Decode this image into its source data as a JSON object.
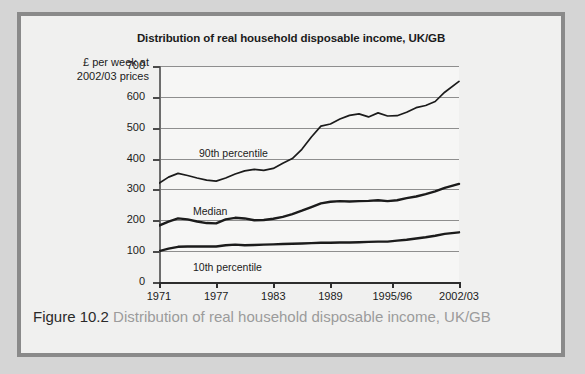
{
  "figure": {
    "number_label": "Figure 10.2",
    "caption_text": "Distribution of real household disposable income, UK/GB"
  },
  "chart_data": {
    "type": "line",
    "title": "Distribution of real household disposable income, UK/GB",
    "ylabel": "£ per week at 2002/03 prices",
    "xlabel": "",
    "ylim": [
      0,
      700
    ],
    "ytick_labels": [
      "0",
      "100",
      "200",
      "300",
      "400",
      "500",
      "600",
      "700"
    ],
    "ytick_values": [
      0,
      100,
      200,
      300,
      400,
      500,
      600,
      700
    ],
    "xtick_labels": [
      "1971",
      "1977",
      "1983",
      "1989",
      "1995/96",
      "2002/03"
    ],
    "xtick_values": [
      1971,
      1977,
      1983,
      1989,
      1995.5,
      2002.5
    ],
    "xlim": [
      1971,
      2002.5
    ],
    "grid": "horizontal",
    "legend_position": "inline-annotations",
    "annotations": [
      {
        "name": "90th percentile",
        "x": 1978,
        "y": 430
      },
      {
        "name": "Median",
        "x": 1977,
        "y": 245
      },
      {
        "name": "10th percentile",
        "x": 1977,
        "y": 68
      }
    ],
    "series": [
      {
        "name": "90th percentile",
        "x": [
          1971,
          1972,
          1973,
          1974,
          1975,
          1976,
          1977,
          1978,
          1979,
          1980,
          1981,
          1982,
          1983,
          1984,
          1985,
          1986,
          1987,
          1988,
          1989,
          1990,
          1991,
          1992,
          1993,
          1994,
          1995,
          1996,
          1997,
          1998,
          1999,
          2000,
          2001,
          2002.5
        ],
        "values": [
          320,
          340,
          352,
          345,
          337,
          330,
          327,
          337,
          350,
          360,
          365,
          362,
          368,
          385,
          400,
          430,
          470,
          505,
          512,
          528,
          540,
          545,
          535,
          548,
          538,
          539,
          550,
          565,
          572,
          585,
          615,
          650
        ]
      },
      {
        "name": "Median",
        "x": [
          1971,
          1972,
          1973,
          1974,
          1975,
          1976,
          1977,
          1978,
          1979,
          1980,
          1981,
          1982,
          1983,
          1984,
          1985,
          1986,
          1987,
          1988,
          1989,
          1990,
          1991,
          1992,
          1993,
          1994,
          1995,
          1996,
          1997,
          1998,
          1999,
          2000,
          2001,
          2002.5
        ],
        "values": [
          183,
          196,
          206,
          203,
          196,
          191,
          190,
          203,
          208,
          206,
          200,
          201,
          205,
          211,
          220,
          231,
          243,
          255,
          260,
          262,
          261,
          262,
          263,
          265,
          262,
          265,
          272,
          277,
          285,
          294,
          305,
          318
        ]
      },
      {
        "name": "10th percentile",
        "x": [
          1971,
          1972,
          1973,
          1974,
          1975,
          1976,
          1977,
          1978,
          1979,
          1980,
          1981,
          1982,
          1983,
          1984,
          1985,
          1986,
          1987,
          1988,
          1989,
          1990,
          1991,
          1992,
          1993,
          1994,
          1995,
          1996,
          1997,
          1998,
          1999,
          2000,
          2001,
          2002.5
        ],
        "values": [
          100,
          108,
          114,
          115,
          115,
          115,
          115,
          119,
          121,
          119,
          120,
          121,
          122,
          123,
          124,
          125,
          126,
          127,
          127,
          128,
          128,
          129,
          130,
          131,
          131,
          134,
          137,
          141,
          145,
          150,
          156,
          161
        ]
      }
    ]
  },
  "colors": {
    "frame_border": "#8a8a8a",
    "page_background": "#d5d5d5",
    "panel_background": "#f0f0ef",
    "plot_background": "#f6f6f5",
    "gridline": "#8e8e8e",
    "series_line": "#1b1b1b",
    "caption_gray": "#9b9b9b",
    "caption_dark": "#2a2a2a"
  }
}
